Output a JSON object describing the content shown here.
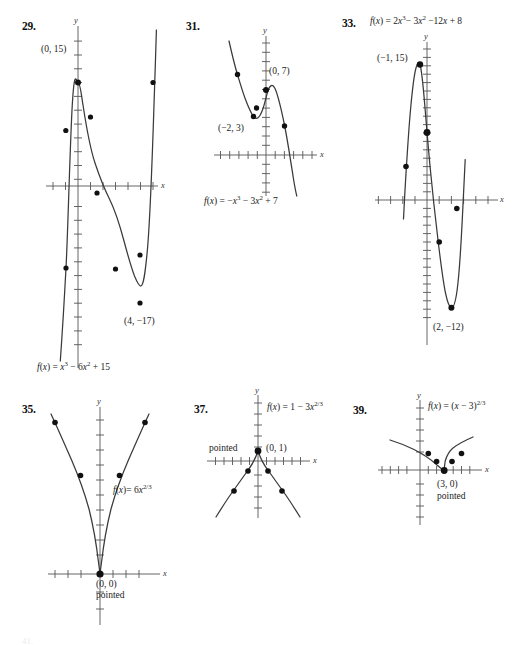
{
  "page": {
    "width": 516,
    "height": 645,
    "background": "#ffffff",
    "ink": "#3a3a3a"
  },
  "problems": [
    {
      "number": "29.",
      "equation_html": "<i>f</i>(<i>x</i>) = <i>x</i><sup>3</sup> &minus; 6<i>x</i><sup>2</sup> + 15",
      "equation_text": "f(x) = x^3 - 6x^2 + 15",
      "axis_x_label": "x",
      "axis_y_label": "y",
      "annotations": [
        "(0, 15)",
        "(4, −17)"
      ],
      "chart_data": {
        "type": "line",
        "title": "29.",
        "function": "f(x) = x^3 - 6x^2 + 15",
        "xlabel": "x",
        "ylabel": "y",
        "xlim": [
          -3.2,
          7.2
        ],
        "ylim": [
          -24,
          22
        ],
        "grid": false,
        "legend": false,
        "labeled_points": [
          {
            "label": "(0, 15)",
            "x": 0,
            "y": 15
          },
          {
            "label": "(4, −17)",
            "x": 4,
            "y": -17
          }
        ],
        "plotted_points": [
          {
            "x": -1,
            "y": 8
          },
          {
            "x": 0,
            "y": 15
          },
          {
            "x": 1,
            "y": 10
          },
          {
            "x": 2,
            "y": -1
          },
          {
            "x": 3,
            "y": -12
          },
          {
            "x": 4,
            "y": -17
          },
          {
            "x": 5,
            "y": -10
          },
          {
            "x": 6,
            "y": 15
          }
        ]
      }
    },
    {
      "number": "31.",
      "equation_html": "<i>f</i>(<i>x</i>) = &minus;<i>x</i><sup>3</sup> &minus; 3<i>x</i><sup>2</sup> + 7",
      "equation_text": "f(x) = -x^3 - 3x^2 + 7",
      "axis_x_label": "x",
      "axis_y_label": "y",
      "annotations": [
        "(0, 7)",
        "(−2, 3)"
      ],
      "chart_data": {
        "type": "line",
        "title": "31.",
        "function": "f(x) = -x^3 - 3x^2 + 7",
        "xlabel": "x",
        "ylabel": "y",
        "xlim": [
          -5.5,
          5.5
        ],
        "ylim": [
          -9,
          12
        ],
        "grid": false,
        "legend": false,
        "labeled_points": [
          {
            "label": "(0, 7)",
            "x": 0,
            "y": 7
          },
          {
            "label": "(−2, 3)",
            "x": -2,
            "y": 3
          }
        ],
        "plotted_points": [
          {
            "x": -3,
            "y": 7
          },
          {
            "x": -2,
            "y": 3
          },
          {
            "x": -1,
            "y": 5
          },
          {
            "x": 0,
            "y": 7
          },
          {
            "x": 1,
            "y": 3
          }
        ]
      }
    },
    {
      "number": "33.",
      "equation_html": "<i>f</i>(<i>x</i>) = 2<i>x</i><sup>3</sup>&minus; 3<i>x</i><sup>2</sup> &minus;12<i>x</i> + 8",
      "equation_text": "f(x) = 2x^3 - 3x^2 - 12x + 8",
      "axis_x_label": "x",
      "axis_y_label": "y",
      "annotations": [
        "(−1, 15)",
        "(2, −12)"
      ],
      "chart_data": {
        "type": "line",
        "title": "33.",
        "function": "f(x) = 2x^3 - 3x^2 - 12x + 8",
        "xlabel": "x",
        "ylabel": "y",
        "xlim": [
          -4.5,
          5.0
        ],
        "ylim": [
          -18,
          20
        ],
        "grid": false,
        "legend": false,
        "labeled_points": [
          {
            "label": "(−1, 15)",
            "x": -1,
            "y": 15
          },
          {
            "label": "(2, −12)",
            "x": 2,
            "y": -12
          }
        ],
        "plotted_points": [
          {
            "x": -2,
            "y": 4
          },
          {
            "x": -1,
            "y": 15
          },
          {
            "x": 0,
            "y": 8
          },
          {
            "x": 1,
            "y": -5
          },
          {
            "x": 2,
            "y": -12
          },
          {
            "x": 3,
            "y": -1
          }
        ]
      }
    },
    {
      "number": "35.",
      "equation_html": "<i>f</i>(<i>x</i>)= 6<i>x</i><sup>2/3</sup>",
      "equation_text": "f(x) = 6x^(2/3)",
      "axis_x_label": "x",
      "axis_y_label": "y",
      "annotations": [
        "(0, 0)",
        "pointed"
      ],
      "chart_data": {
        "type": "line",
        "title": "35.",
        "function": "f(x) = 6x^(2/3)",
        "xlabel": "x",
        "ylabel": "y",
        "xlim": [
          -4.5,
          4.5
        ],
        "ylim": [
          -3,
          16
        ],
        "grid": false,
        "legend": false,
        "labeled_points": [
          {
            "label": "(0, 0)",
            "x": 0,
            "y": 0
          }
        ],
        "plotted_points": [
          {
            "x": -3,
            "y": 12.5
          },
          {
            "x": -1.6,
            "y": 8.2
          },
          {
            "x": 0,
            "y": 0
          },
          {
            "x": 1.6,
            "y": 8.2
          },
          {
            "x": 3,
            "y": 12.5
          }
        ]
      }
    },
    {
      "number": "37.",
      "equation_html": "<i>f</i>(<i>x</i>) = 1 &minus; 3<i>x</i><sup>2/3</sup>",
      "equation_text": "f(x) = 1 - 3x^(2/3)",
      "axis_x_label": "x",
      "axis_y_label": "y",
      "annotations": [
        "pointed",
        "(0, 1)"
      ],
      "chart_data": {
        "type": "line",
        "title": "37.",
        "function": "f(x) = 1 - 3x^(2/3)",
        "xlabel": "x",
        "ylabel": "y",
        "xlim": [
          -5.5,
          5.5
        ],
        "ylim": [
          -9,
          7
        ],
        "grid": false,
        "legend": false,
        "labeled_points": [
          {
            "label": "(0, 1)",
            "x": 0,
            "y": 1
          }
        ],
        "plotted_points": [
          {
            "x": -2.6,
            "y": -4.6
          },
          {
            "x": -1.1,
            "y": -2.2
          },
          {
            "x": 0,
            "y": 1
          },
          {
            "x": 1.1,
            "y": -2.2
          },
          {
            "x": 2.6,
            "y": -4.6
          }
        ]
      }
    },
    {
      "number": "39.",
      "equation_html": "<i>f</i>(<i>x</i>) = (<i>x</i> &minus; 3)<sup>2/3</sup>",
      "equation_text": "f(x) = (x - 3)^(2/3)",
      "axis_x_label": "x",
      "axis_y_label": "y",
      "annotations": [
        "(3, 0)",
        "pointed"
      ],
      "chart_data": {
        "type": "line",
        "title": "39.",
        "function": "f(x) = (x - 3)^(2/3)",
        "xlabel": "x",
        "ylabel": "y",
        "xlim": [
          -5.5,
          6.5
        ],
        "ylim": [
          -7,
          6
        ],
        "grid": false,
        "legend": false,
        "labeled_points": [
          {
            "label": "(3, 0)",
            "x": 3,
            "y": 0
          }
        ],
        "plotted_points": [
          {
            "x": 1.2,
            "y": 1.5
          },
          {
            "x": 2.2,
            "y": 0.85
          },
          {
            "x": 3,
            "y": 0
          },
          {
            "x": 3.8,
            "y": 0.85
          },
          {
            "x": 4.8,
            "y": 1.5
          }
        ]
      }
    }
  ],
  "footer": {
    "cut_text": "41."
  }
}
